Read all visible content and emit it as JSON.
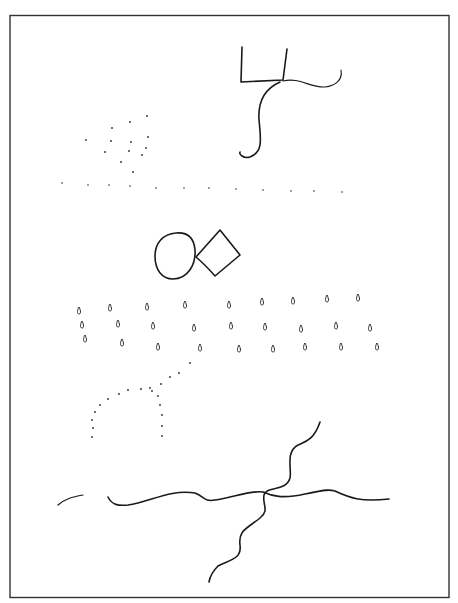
{
  "figure": {
    "frame": {
      "x": 10,
      "y": 15,
      "width": 439,
      "height": 583
    },
    "colors": {
      "background": "#ffffff",
      "ink": "#1a1a1a"
    },
    "groups": [
      {
        "id": "open-box-with-tail",
        "description": "open-top rectangle with curved tail and S-curve"
      },
      {
        "id": "dot-cluster",
        "description": "scattered dots forming a curved cluster"
      },
      {
        "id": "dot-row",
        "description": "horizontal row of evenly spaced dots"
      },
      {
        "id": "circle-and-diamond",
        "description": "irregular circle touching a tilted square"
      },
      {
        "id": "teardrop-grid",
        "description": "three rows of small teardrop marks"
      },
      {
        "id": "dotted-arc",
        "description": "dotted arch curve"
      },
      {
        "id": "crossing-wavy-lines",
        "description": "two wavy lines crossing each other"
      }
    ]
  },
  "dot_cluster": [
    [
      86,
      140
    ],
    [
      112,
      128
    ],
    [
      130,
      122
    ],
    [
      147,
      116
    ],
    [
      111,
      141
    ],
    [
      131,
      142
    ],
    [
      148,
      137
    ],
    [
      105,
      152
    ],
    [
      129,
      151
    ],
    [
      146,
      148
    ],
    [
      121,
      162
    ],
    [
      142,
      155
    ],
    [
      133,
      172
    ]
  ],
  "dot_row": [
    [
      62,
      183
    ],
    [
      88,
      185
    ],
    [
      109,
      185
    ],
    [
      130,
      186
    ],
    [
      156,
      188
    ],
    [
      184,
      188
    ],
    [
      209,
      188
    ],
    [
      236,
      189
    ],
    [
      263,
      190
    ],
    [
      291,
      191
    ],
    [
      314,
      191
    ],
    [
      342,
      192
    ]
  ],
  "teardrops": [
    [
      [
        79,
        311
      ],
      [
        110,
        308
      ],
      [
        147,
        307
      ],
      [
        185,
        305
      ],
      [
        229,
        305
      ],
      [
        262,
        302
      ],
      [
        293,
        301
      ],
      [
        327,
        299
      ],
      [
        358,
        298
      ]
    ],
    [
      [
        82,
        325
      ],
      [
        118,
        324
      ],
      [
        153,
        326
      ],
      [
        194,
        328
      ],
      [
        231,
        326
      ],
      [
        265,
        327
      ],
      [
        301,
        329
      ],
      [
        336,
        326
      ],
      [
        370,
        328
      ]
    ],
    [
      [
        85,
        339
      ],
      [
        122,
        343
      ],
      [
        158,
        347
      ],
      [
        200,
        348
      ],
      [
        239,
        349
      ],
      [
        273,
        349
      ],
      [
        305,
        347
      ],
      [
        341,
        347
      ],
      [
        377,
        347
      ]
    ]
  ],
  "dotted_arc": [
    [
      92,
      437
    ],
    [
      93,
      428
    ],
    [
      92,
      420
    ],
    [
      95,
      412
    ],
    [
      100,
      405
    ],
    [
      108,
      399
    ],
    [
      119,
      394
    ],
    [
      128,
      390
    ],
    [
      141,
      389
    ],
    [
      152,
      391
    ],
    [
      158,
      396
    ],
    [
      160,
      405
    ],
    [
      162,
      415
    ],
    [
      162,
      426
    ],
    [
      162,
      436
    ],
    [
      150,
      388
    ],
    [
      161,
      384
    ],
    [
      170,
      377
    ],
    [
      179,
      373
    ],
    [
      190,
      363
    ]
  ]
}
